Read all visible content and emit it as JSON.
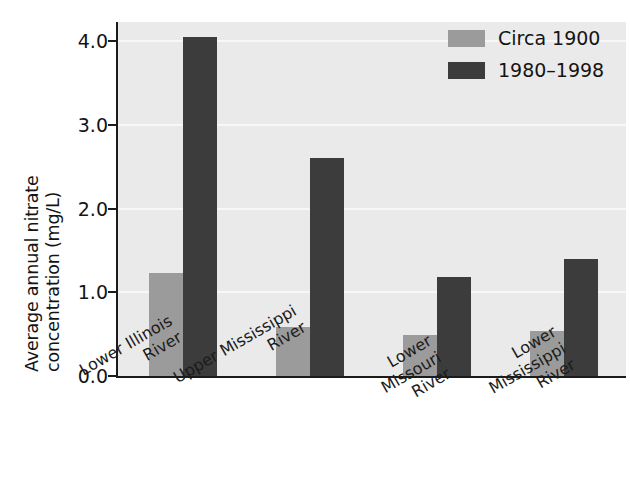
{
  "chart_data": {
    "type": "bar",
    "title": "",
    "xlabel": "",
    "ylabel": "Average annual nitrate concentration (mg/L)",
    "ylabel_lines": [
      "Average annual nitrate",
      "concentration (mg/L)"
    ],
    "ylim": [
      0.0,
      4.35
    ],
    "ytick_labels": [
      "0.0",
      "1.0",
      "2.0",
      "3.0",
      "4.0"
    ],
    "ytick_values": [
      0.0,
      1.0,
      2.0,
      3.0,
      4.0
    ],
    "grid": true,
    "grid_axis": "y",
    "legend_position": "top-right",
    "categories": [
      "Lower Illinois River",
      "Upper Mississippi River",
      "Lower Missouri River",
      "Lower Mississippi River"
    ],
    "category_lines": [
      [
        "Lower Illinois",
        "River"
      ],
      [
        "Upper Mississippi",
        "River"
      ],
      [
        "Lower",
        "Missouri",
        "River"
      ],
      [
        "Lower",
        "Mississippi",
        "River"
      ]
    ],
    "series": [
      {
        "name": "Circa 1900",
        "color": "#9b9b9b",
        "values": [
          1.23,
          0.59,
          0.49,
          0.54
        ]
      },
      {
        "name": "1980–1998",
        "color": "#3c3c3c",
        "values": [
          4.05,
          2.6,
          1.18,
          1.4
        ]
      }
    ],
    "units": "mg/L",
    "plot_background": "#eaeaea",
    "gridline_color": "#f7f7f7",
    "axis_color": "#1b1b1b"
  }
}
